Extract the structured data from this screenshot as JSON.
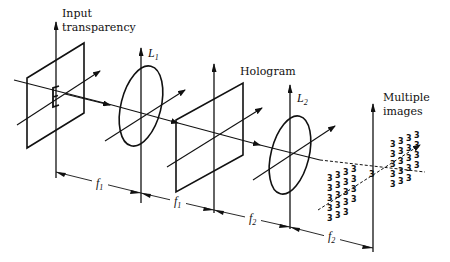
{
  "figure": {
    "type": "optical-system-schematic",
    "labels": {
      "input_transparency_line1": "Input",
      "input_transparency_line2": "transparency",
      "lens1": "L",
      "lens1_sub": "1",
      "hologram": "Hologram",
      "lens2": "L",
      "lens2_sub": "2",
      "multiple_images_line1": "Multiple",
      "multiple_images_line2": "images"
    },
    "input_glyph": "E",
    "output_glyph": "3",
    "distances": [
      {
        "label": "f",
        "sub": "1"
      },
      {
        "label": "f",
        "sub": "1"
      },
      {
        "label": "f",
        "sub": "2"
      },
      {
        "label": "f",
        "sub": "2"
      }
    ],
    "elements": [
      "Input transparency",
      "L1",
      "Hologram",
      "L2",
      "Multiple images"
    ],
    "stroke_color": "#111111",
    "background_color": "#ffffff"
  }
}
